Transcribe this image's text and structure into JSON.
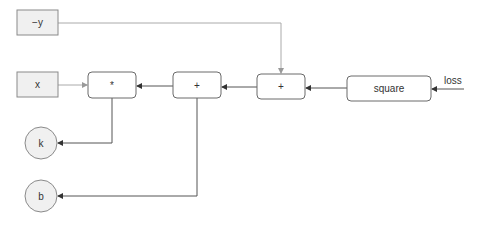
{
  "diagram": {
    "type": "computation-graph",
    "nodes": {
      "neg_y": {
        "label": "−y",
        "shape": "rect"
      },
      "x": {
        "label": "x",
        "shape": "rect"
      },
      "mul": {
        "label": "*",
        "shape": "rounded-rect"
      },
      "add1": {
        "label": "+",
        "shape": "rounded-rect"
      },
      "add2": {
        "label": "+",
        "shape": "rounded-rect"
      },
      "square": {
        "label": "square",
        "shape": "rounded-rect"
      },
      "k": {
        "label": "k",
        "shape": "circle"
      },
      "b": {
        "label": "b",
        "shape": "circle"
      }
    },
    "loss_label": "loss",
    "edges": [
      {
        "from": "loss",
        "to": "square"
      },
      {
        "from": "square",
        "to": "add2"
      },
      {
        "from": "add2",
        "to": "add1"
      },
      {
        "from": "neg_y",
        "to": "add2"
      },
      {
        "from": "add1",
        "to": "mul"
      },
      {
        "from": "x",
        "to": "mul"
      },
      {
        "from": "mul",
        "to": "k"
      },
      {
        "from": "add1",
        "to": "b"
      }
    ],
    "colors": {
      "input_fill": "#f0f0f0",
      "border": "#8a8a8a",
      "edge_dark": "#555555",
      "edge_light": "#aaaaaa"
    }
  }
}
